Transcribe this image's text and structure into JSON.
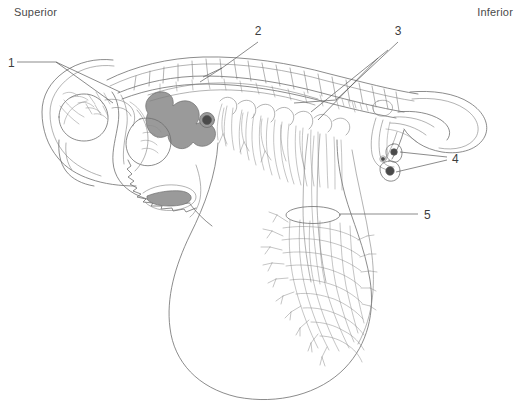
{
  "figure": {
    "background_color": "#ffffff",
    "line_color": "#6e6e6e",
    "shade_color": "#9a9a9a",
    "dark_fill_color": "#4a4a4a",
    "label_color": "#3d3d3d"
  },
  "orientation": {
    "superior": "Superior",
    "inferior": "Inferior"
  },
  "callouts": [
    {
      "id": "1",
      "label": "1",
      "x": 8,
      "y": 64
    },
    {
      "id": "2",
      "label": "2",
      "x": 258,
      "y": 32
    },
    {
      "id": "3",
      "label": "3",
      "x": 397,
      "y": 32
    },
    {
      "id": "4",
      "label": "4",
      "x": 452,
      "y": 159
    },
    {
      "id": "5",
      "label": "5",
      "x": 424,
      "y": 217
    }
  ]
}
